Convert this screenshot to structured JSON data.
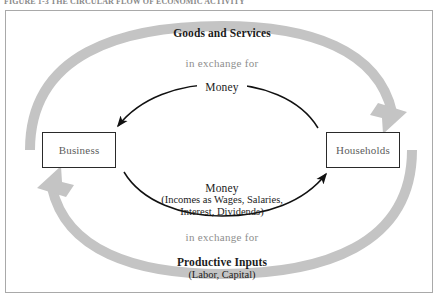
{
  "figure": {
    "caption": "FIGURE 1-3   THE CIRCULAR FLOW OF ECONOMIC ACTIVITY"
  },
  "diagram": {
    "type": "circular-flow",
    "entities": [
      {
        "id": "business",
        "label": "Business"
      },
      {
        "id": "households",
        "label": "Households"
      }
    ],
    "outer_flows": [
      {
        "id": "goods-and-services",
        "title": "Goods and Services",
        "connector": "in exchange for",
        "direction": "business-to-households",
        "position": "top",
        "color": "#c4c4c4"
      },
      {
        "id": "productive-inputs",
        "title": "Productive Inputs",
        "subtitle": "(Labor, Capital)",
        "connector": "in exchange for",
        "direction": "households-to-business",
        "position": "bottom",
        "color": "#c4c4c4"
      }
    ],
    "inner_flows": [
      {
        "id": "money-to-business",
        "label": "Money",
        "direction": "households-to-business",
        "position": "top",
        "color": "#111111"
      },
      {
        "id": "money-to-households",
        "label": "Money",
        "detail_line_1": "(Incomes as Wages, Salaries,",
        "detail_line_2": "Interest, Dividends)",
        "direction": "business-to-households",
        "position": "bottom",
        "color": "#111111"
      }
    ],
    "colors": {
      "frame_border": "#a9a9a9",
      "box_border": "#2a2a2a",
      "box_text": "#5d5d5d",
      "arc_gray": "#c4c4c4",
      "arrow_black": "#111111",
      "muted_text": "#8e8e8e",
      "strong_text": "#1c1c1c"
    }
  }
}
